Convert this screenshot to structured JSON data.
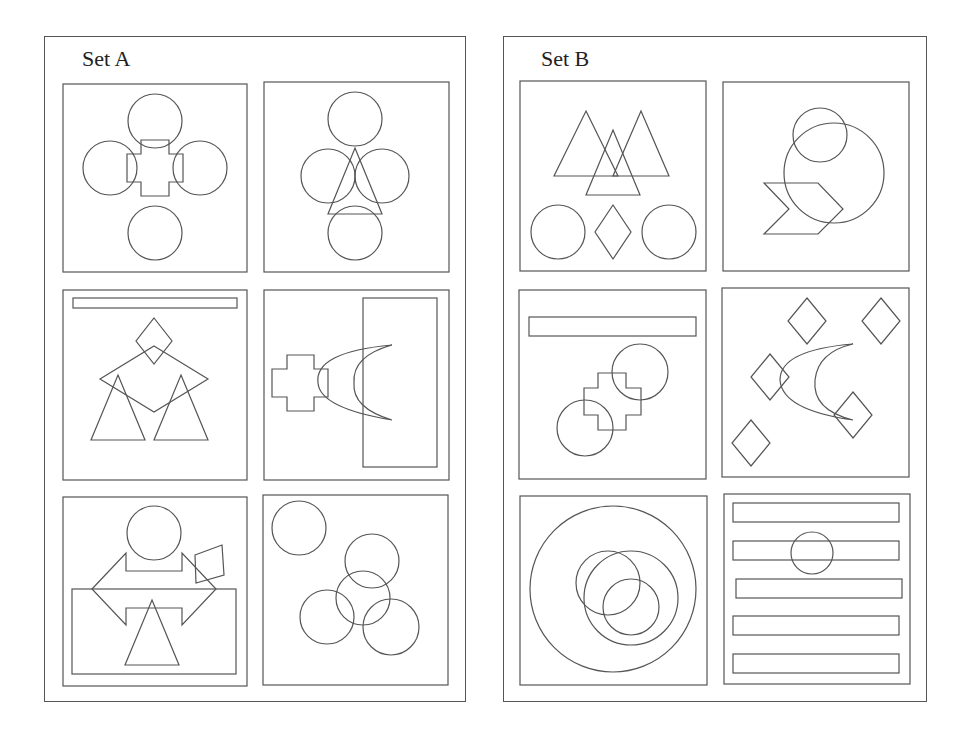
{
  "sets": [
    {
      "id": "A",
      "title": "Set A",
      "panels": [
        {
          "name": "cross-with-four-circles",
          "shapes": [
            "circle",
            "circle",
            "circle",
            "circle",
            "cross"
          ]
        },
        {
          "name": "triangle-with-four-circles",
          "shapes": [
            "circle",
            "circle",
            "circle",
            "circle",
            "triangle"
          ]
        },
        {
          "name": "bar-diamond-two-triangles",
          "shapes": [
            "bar",
            "diamond",
            "diamond",
            "triangle",
            "triangle"
          ]
        },
        {
          "name": "cross-crescent-rectangle",
          "shapes": [
            "cross",
            "crescent",
            "rectangle"
          ]
        },
        {
          "name": "double-arrow-circle-triangle",
          "shapes": [
            "circle",
            "double-arrow",
            "quadrilateral",
            "rectangle",
            "triangle"
          ]
        },
        {
          "name": "five-circles",
          "shapes": [
            "circle",
            "circle",
            "circle",
            "circle",
            "circle"
          ]
        }
      ]
    },
    {
      "id": "B",
      "title": "Set B",
      "panels": [
        {
          "name": "three-triangles-circles-diamond",
          "shapes": [
            "triangle",
            "triangle",
            "triangle",
            "circle",
            "diamond",
            "circle"
          ]
        },
        {
          "name": "two-circles-chevron",
          "shapes": [
            "circle",
            "circle",
            "chevron"
          ]
        },
        {
          "name": "bar-cross-two-circles",
          "shapes": [
            "bar",
            "cross",
            "circle",
            "circle"
          ]
        },
        {
          "name": "crescent-four-diamonds",
          "shapes": [
            "crescent",
            "diamond",
            "diamond",
            "diamond",
            "diamond",
            "diamond"
          ]
        },
        {
          "name": "nested-circles",
          "shapes": [
            "circle",
            "circle",
            "circle",
            "circle"
          ]
        },
        {
          "name": "five-bars-circle",
          "shapes": [
            "bar",
            "bar",
            "bar",
            "bar",
            "bar",
            "circle"
          ]
        }
      ]
    }
  ]
}
